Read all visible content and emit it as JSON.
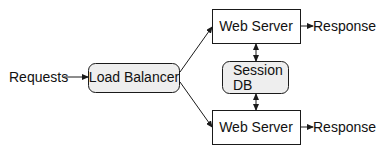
{
  "diagram": {
    "input_label": "Requests",
    "load_balancer": {
      "label": "Load Balancer"
    },
    "servers": [
      {
        "label": "Web Server",
        "output_label": "Response"
      },
      {
        "label": "Web Server",
        "output_label": "Response"
      }
    ],
    "session_db": {
      "line1": "Session",
      "line2": "DB"
    },
    "colors": {
      "stroke": "#1a1a1a",
      "rounded_fill": "#eeeeee",
      "box_fill": "#ffffff"
    }
  }
}
